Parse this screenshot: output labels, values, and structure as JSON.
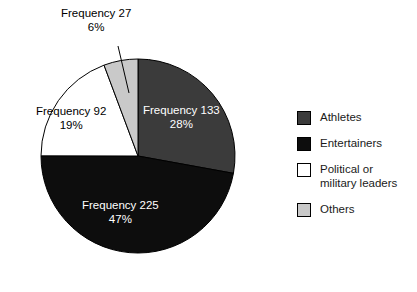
{
  "chart_data": {
    "type": "pie",
    "title": "",
    "total": 477,
    "categories": [
      "Athletes",
      "Entertainers",
      "Political or military leaders",
      "Others"
    ],
    "values": [
      133,
      225,
      92,
      27
    ],
    "percentages": [
      28,
      47,
      19,
      6
    ],
    "slices": [
      {
        "name": "Athletes",
        "value": 133,
        "percent": 28,
        "freq_label": "Frequency 133",
        "pct_label": "28%",
        "color": "#3b3b3b",
        "label_color": "#ffffff",
        "start_angle": 0,
        "end_angle": 100.3,
        "label_placement": "inside"
      },
      {
        "name": "Entertainers",
        "value": 225,
        "percent": 47,
        "freq_label": "Frequency 225",
        "pct_label": "47%",
        "color": "#0d0d0d",
        "label_color": "#ffffff",
        "start_angle": 100.3,
        "end_angle": 270.1,
        "label_placement": "inside"
      },
      {
        "name": "Political or military leaders",
        "value": 92,
        "percent": 19,
        "freq_label": "Frequency 92",
        "pct_label": "19%",
        "color": "#ffffff",
        "label_color": "#000000",
        "start_angle": 270.1,
        "end_angle": 339.5,
        "label_placement": "inside"
      },
      {
        "name": "Others",
        "value": 27,
        "percent": 6,
        "freq_label": "Frequency 27",
        "pct_label": "6%",
        "color": "#c9c9c9",
        "label_color": "#000000",
        "start_angle": 339.5,
        "end_angle": 360,
        "label_placement": "outside-callout"
      }
    ],
    "geometry": {
      "center_x": 138,
      "center_y": 156,
      "radius": 97,
      "start_at_twelve_oclock": true,
      "direction": "clockwise",
      "outline_color": "#000000"
    },
    "callout": {
      "from_x": 118,
      "from_y": 46,
      "to_x": 129,
      "to_y": 93,
      "color": "#000000"
    },
    "legend": {
      "position": "right",
      "entries": [
        {
          "label": "Athletes",
          "color": "#3b3b3b"
        },
        {
          "label": "Entertainers",
          "color": "#0d0d0d"
        },
        {
          "label": "Political or\nmilitary leaders",
          "color": "#ffffff"
        },
        {
          "label": "Others",
          "color": "#c9c9c9"
        }
      ]
    }
  }
}
